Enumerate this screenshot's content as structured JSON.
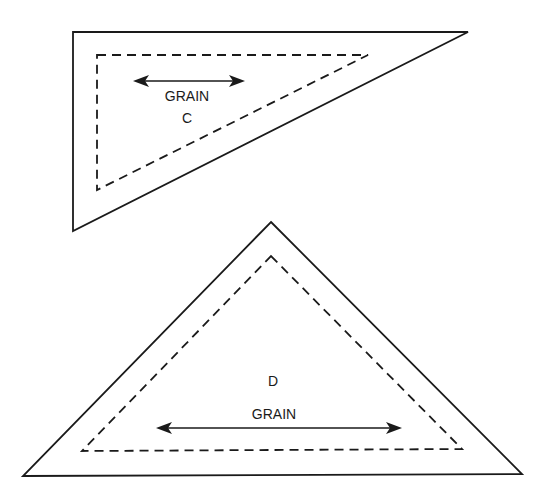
{
  "diagram": {
    "colors": {
      "line": "#1a1a1a",
      "background": "#ffffff"
    },
    "pieces": [
      {
        "id": "C",
        "label": "C",
        "grain_label": "GRAIN",
        "shape": "right triangle",
        "cutting_line": [
          [
            73,
            32
          ],
          [
            468,
            32
          ],
          [
            73,
            231
          ]
        ],
        "seam_line": [
          [
            97,
            55
          ],
          [
            368,
            55
          ],
          [
            97,
            190
          ]
        ],
        "grain_arrow": {
          "x1": 133,
          "x2": 245,
          "y": 81
        },
        "grain_label_pos": [
          187,
          101
        ],
        "label_pos": [
          187,
          123
        ]
      },
      {
        "id": "D",
        "label": "D",
        "grain_label": "GRAIN",
        "shape": "isosceles triangle",
        "cutting_line": [
          [
            271,
            222
          ],
          [
            522,
            474
          ],
          [
            23,
            476
          ]
        ],
        "seam_line": [
          [
            271,
            256
          ],
          [
            462,
            449
          ],
          [
            82,
            451
          ]
        ],
        "grain_arrow": {
          "x1": 156,
          "x2": 402,
          "y": 428
        },
        "grain_label_pos": [
          274,
          419
        ],
        "label_pos": [
          273,
          386
        ]
      }
    ]
  }
}
